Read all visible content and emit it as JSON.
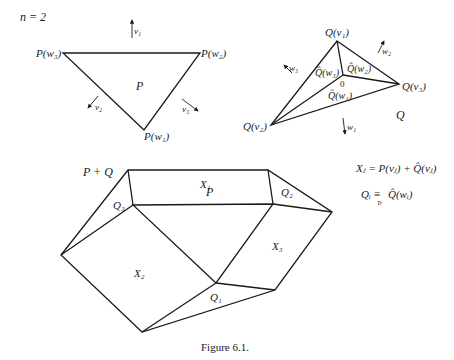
{
  "figure": {
    "caption": "Figure 6.1.",
    "n_label": "n = 2",
    "polygon_P": {
      "name": "P",
      "vertices": [
        "P(w₃)",
        "P(w₂)",
        "P(w₁)"
      ],
      "normals": [
        "v₁",
        "v₂",
        "v₃"
      ]
    },
    "polygon_Q": {
      "name": "Q",
      "vertices": [
        "Q(v₁)",
        "Q(v₂)",
        "Q(v₃)"
      ],
      "inner_labels": [
        "Q̂(w₃)",
        "Q̂(w₂)",
        "Q̂(w₁)"
      ],
      "origin": "0",
      "normals": [
        "w₁",
        "w₂",
        "w₃"
      ]
    },
    "minkowski_sum": {
      "name": "P + Q",
      "inner": "P",
      "faces": [
        "X₁",
        "X₂",
        "X₃",
        "Q₁",
        "Q₂",
        "Q₃"
      ]
    },
    "formulas": {
      "x_formula": "Xⱼ = P(vⱼ) + Q̂(vⱼ)",
      "q_formula_left": "Qᵢ ≡",
      "q_formula_sub": "Tr",
      "q_formula_right": "Q̂(wᵢ)"
    }
  }
}
